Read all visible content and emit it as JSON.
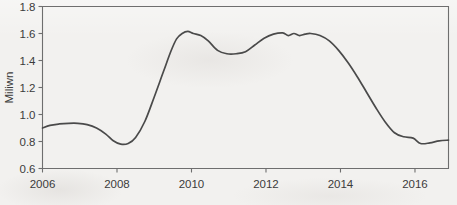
{
  "chart_data": {
    "type": "line",
    "title": "",
    "subtitle": "",
    "xlabel": "",
    "ylabel": "Miliwn",
    "xlim": [
      2006,
      2016.9
    ],
    "ylim": [
      0.6,
      1.8
    ],
    "grid": false,
    "legend": null,
    "x_tick_labels": [
      "2006",
      "2008",
      "2010",
      "2012",
      "2014",
      "2016"
    ],
    "x_ticks": [
      2006,
      2008,
      2010,
      2012,
      2014,
      2016
    ],
    "y_tick_labels": [
      "0.6",
      "0.8",
      "1.0",
      "1.2",
      "1.4",
      "1.6",
      "1.8"
    ],
    "y_ticks": [
      0.6,
      0.8,
      1.0,
      1.2,
      1.4,
      1.6,
      1.8
    ],
    "series": [
      {
        "name": "series-1",
        "color": "#4a4a4a",
        "x": [
          2006.0,
          2006.2,
          2006.45,
          2006.7,
          2006.95,
          2007.2,
          2007.45,
          2007.7,
          2007.9,
          2008.1,
          2008.3,
          2008.5,
          2008.75,
          2009.0,
          2009.25,
          2009.45,
          2009.6,
          2009.75,
          2009.9,
          2010.05,
          2010.25,
          2010.45,
          2010.7,
          2010.95,
          2011.2,
          2011.45,
          2011.7,
          2011.95,
          2012.2,
          2012.45,
          2012.6,
          2012.75,
          2012.9,
          2013.05,
          2013.2,
          2013.45,
          2013.7,
          2013.95,
          2014.2,
          2014.45,
          2014.7,
          2014.95,
          2015.2,
          2015.45,
          2015.7,
          2015.95,
          2016.15,
          2016.4,
          2016.65,
          2016.9
        ],
        "y": [
          0.9,
          0.92,
          0.93,
          0.935,
          0.935,
          0.925,
          0.9,
          0.855,
          0.805,
          0.78,
          0.785,
          0.83,
          0.95,
          1.13,
          1.32,
          1.47,
          1.56,
          1.6,
          1.615,
          1.6,
          1.585,
          1.545,
          1.475,
          1.45,
          1.45,
          1.465,
          1.515,
          1.565,
          1.595,
          1.605,
          1.585,
          1.6,
          1.585,
          1.595,
          1.6,
          1.585,
          1.545,
          1.475,
          1.385,
          1.28,
          1.165,
          1.05,
          0.945,
          0.865,
          0.835,
          0.825,
          0.785,
          0.79,
          0.805,
          0.81
        ]
      }
    ],
    "annotations": []
  }
}
